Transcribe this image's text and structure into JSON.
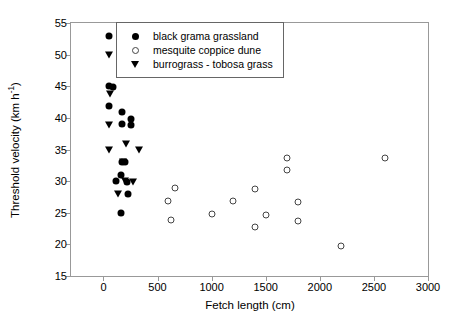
{
  "chart_data": {
    "type": "scatter",
    "title": "",
    "xlabel": "Fetch length (cm)",
    "ylabel_plain": "Threshold velocity (km h-1)",
    "ylabel_main": "Threshold velocity (km h",
    "ylabel_sup": "-1",
    "ylabel_tail": ")",
    "xlim": [
      -300,
      3000
    ],
    "ylim": [
      15,
      55
    ],
    "xticks": [
      0,
      500,
      1000,
      1500,
      2000,
      2500,
      3000
    ],
    "yticks": [
      15,
      20,
      25,
      30,
      35,
      40,
      45,
      50,
      55
    ],
    "xtick_labels": [
      "0",
      "500",
      "1000",
      "1500",
      "2000",
      "2500",
      "3000"
    ],
    "ytick_labels": [
      "15",
      "20",
      "25",
      "30",
      "35",
      "40",
      "45",
      "50",
      "55"
    ],
    "grid": false,
    "legend_position": "upper-center",
    "series": [
      {
        "name": "black grama grassland",
        "marker": "filled-circle",
        "color": "#000000",
        "points": [
          [
            55,
            52.9
          ],
          [
            55,
            45.0
          ],
          [
            85,
            44.9
          ],
          [
            55,
            41.9
          ],
          [
            170,
            41.0
          ],
          [
            170,
            39.0
          ],
          [
            250,
            39.8
          ],
          [
            250,
            38.9
          ],
          [
            175,
            33.1
          ],
          [
            200,
            33.0
          ],
          [
            160,
            31.0
          ],
          [
            115,
            30.0
          ],
          [
            215,
            29.9
          ],
          [
            230,
            28.0
          ],
          [
            165,
            24.9
          ]
        ]
      },
      {
        "name": "mesquite coppice dune",
        "marker": "open-circle",
        "color": "#444444",
        "points": [
          [
            600,
            26.8
          ],
          [
            620,
            23.9
          ],
          [
            660,
            28.9
          ],
          [
            1000,
            24.8
          ],
          [
            1200,
            26.8
          ],
          [
            1400,
            28.8
          ],
          [
            1400,
            22.8
          ],
          [
            1500,
            24.7
          ],
          [
            1700,
            33.7
          ],
          [
            1700,
            31.7
          ],
          [
            1800,
            26.7
          ],
          [
            1800,
            23.7
          ],
          [
            2200,
            19.7
          ],
          [
            2600,
            33.6
          ]
        ]
      },
      {
        "name": "burrograss - tobosa grass",
        "marker": "filled-triangle-down",
        "color": "#000000",
        "points": [
          [
            55,
            49.9
          ],
          [
            60,
            43.8
          ],
          [
            55,
            38.9
          ],
          [
            210,
            35.9
          ],
          [
            55,
            34.9
          ],
          [
            330,
            34.9
          ],
          [
            185,
            33.0
          ],
          [
            195,
            30.0
          ],
          [
            270,
            29.9
          ],
          [
            130,
            28.0
          ]
        ]
      }
    ]
  },
  "legend": {
    "items": [
      {
        "label": "black grama grassland",
        "marker": "filled-circle"
      },
      {
        "label": "mesquite coppice dune",
        "marker": "open-circle"
      },
      {
        "label": "burrograss - tobosa grass",
        "marker": "filled-triangle-down"
      }
    ]
  }
}
